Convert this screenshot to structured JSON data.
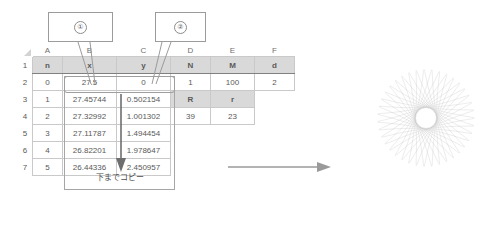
{
  "spreadsheet": {
    "column_headers": [
      "A",
      "B",
      "C",
      "D",
      "E",
      "F"
    ],
    "row_headers": [
      "1",
      "2",
      "3",
      "4",
      "5",
      "6",
      "7"
    ],
    "header_row": {
      "a": "n",
      "b": "x",
      "c": "y",
      "d": "N",
      "e": "M",
      "f": "d"
    },
    "rows": [
      {
        "n": "0",
        "x": "27.5",
        "y": "0",
        "d": "1",
        "e": "100",
        "f": "2"
      },
      {
        "n": "1",
        "x": "27.45744",
        "y": "0.502154",
        "d": "R",
        "e": "r",
        "f": ""
      },
      {
        "n": "2",
        "x": "27.32992",
        "y": "1.001302",
        "d": "39",
        "e": "23",
        "f": ""
      },
      {
        "n": "3",
        "x": "27.11787",
        "y": "1.494454",
        "d": "",
        "e": "",
        "f": ""
      },
      {
        "n": "4",
        "x": "26.82201",
        "y": "1.978647",
        "d": "",
        "e": "",
        "f": ""
      },
      {
        "n": "5",
        "x": "26.44336",
        "y": "2.450957",
        "d": "",
        "e": "",
        "f": ""
      }
    ]
  },
  "annotations": {
    "callout_1": "①",
    "callout_2": "②",
    "copy_down_caption": "下までコピー"
  },
  "figure": {
    "name": "spirograph-rosette"
  },
  "colors": {
    "header_fill": "#d9d9d9",
    "grid_line": "#c9c9c9",
    "text": "#595959",
    "annotation_border": "#9b9b9b",
    "curve": "#9a9a9a"
  }
}
